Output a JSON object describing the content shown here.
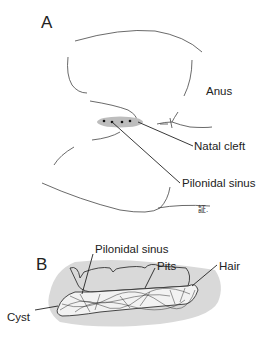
{
  "panel_a": {
    "letter": "A",
    "labels": {
      "anus": "Anus",
      "natal_cleft": "Natal cleft",
      "pilonidal_sinus": "Pilonidal sinus"
    },
    "signature": "証."
  },
  "panel_b": {
    "letter": "B",
    "labels": {
      "pilonidal_sinus": "Pilonidal sinus",
      "pits": "Pits",
      "hair": "Hair",
      "cyst": "Cyst"
    }
  },
  "colors": {
    "line": "#333333",
    "tissue_gray": "#d9d9d9",
    "sinus_gray": "#bdbdbd",
    "background": "#ffffff"
  }
}
